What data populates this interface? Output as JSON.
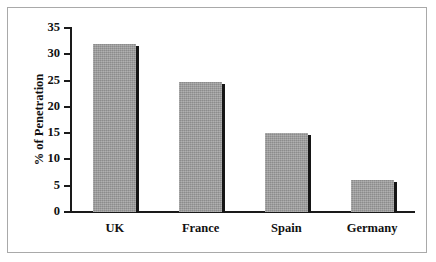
{
  "chart_data": {
    "type": "bar",
    "title": "",
    "xlabel": "",
    "ylabel": "% of Penetration",
    "categories": [
      "UK",
      "France",
      "Spain",
      "Germany"
    ],
    "values": [
      32,
      24.8,
      15,
      6
    ],
    "ylim": [
      0,
      35
    ],
    "ytick_labels": [
      "0",
      "5",
      "10",
      "15",
      "20",
      "25",
      "30",
      "35"
    ],
    "ytick_values": [
      0,
      5,
      10,
      15,
      20,
      25,
      30,
      35
    ],
    "grid": false,
    "legend": false,
    "legend_position": "none",
    "series": [
      {
        "name": "% of Penetration",
        "values": [
          32,
          24.8,
          15,
          6
        ]
      }
    ],
    "colors": {
      "bar_fill": "#9d9d9d",
      "bar_shadow": "#161616",
      "axis": "#1a1a1a",
      "text": "#111111",
      "frame_border": "#a9a9a9",
      "background": "#ffffff"
    }
  }
}
